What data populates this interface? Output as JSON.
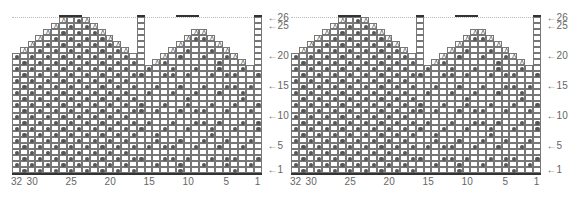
{
  "charts": [
    {
      "id": "left",
      "x0": 12
    },
    {
      "id": "right",
      "x0": 291
    }
  ],
  "grid": {
    "columns": 32,
    "rows": 26,
    "cell_w": 7.8,
    "cell_h": 6,
    "bottom": 173
  },
  "row_labels": [
    {
      "row": 26,
      "text": "←26"
    },
    {
      "row": 25,
      "text": "←25"
    },
    {
      "row": 20,
      "text": "←20"
    },
    {
      "row": 15,
      "text": "←15"
    },
    {
      "row": 10,
      "text": "←10"
    },
    {
      "row": 5,
      "text": "←5"
    },
    {
      "row": 1,
      "text": "←1"
    }
  ],
  "column_labels": [
    {
      "col": 32,
      "text": "32"
    },
    {
      "col": 30,
      "text": "30"
    },
    {
      "col": 25,
      "text": "25"
    },
    {
      "col": 20,
      "text": "20"
    },
    {
      "col": 15,
      "text": "15"
    },
    {
      "col": 10,
      "text": "10"
    },
    {
      "col": 5,
      "text": "5"
    },
    {
      "col": 1,
      "text": "1"
    }
  ],
  "legend": {
    "dot": "contrast color stitch",
    "A": "decrease",
    "empty": "main color stitch"
  },
  "colors": {
    "grid": "#777777",
    "dot": "#555555",
    "bar": "#333333"
  }
}
